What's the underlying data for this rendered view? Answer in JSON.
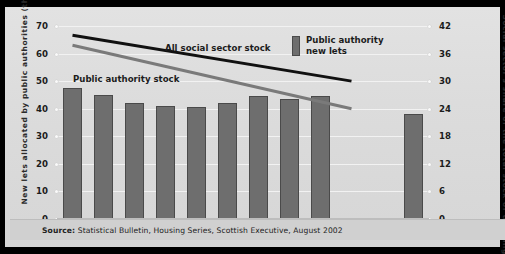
{
  "chart_data": {
    "type": "bar",
    "title": "",
    "xlabel": "",
    "ylabel": "New lets allocated by public authorities (thousands)",
    "ylabel_right": "Social sector's share of the total stock of dwellings (per cent)",
    "categories": [
      "1991",
      "1992",
      "1993",
      "1994",
      "1995",
      "1996",
      "1997",
      "1998",
      "1999",
      "2000",
      "2001",
      "2002"
    ],
    "ylim": [
      0,
      70
    ],
    "yticks": [
      0,
      10,
      20,
      30,
      40,
      50,
      60,
      70
    ],
    "ylim_right": [
      0,
      42
    ],
    "yticks_right": [
      0,
      6,
      12,
      18,
      24,
      30,
      36,
      42
    ],
    "grid": true,
    "legend_position": "top-right",
    "series": [
      {
        "name": "Public authority new lets",
        "type": "bar",
        "axis": "left",
        "color": "#6e6e6e",
        "values": [
          47.5,
          45.0,
          42.0,
          41.0,
          40.5,
          42.0,
          44.5,
          43.5,
          44.5,
          null,
          null,
          38.0
        ]
      },
      {
        "name": "All social sector stock",
        "type": "line",
        "axis": "right",
        "color": "#111111",
        "x": [
          "1991",
          "2000"
        ],
        "values": [
          40.0,
          30.0
        ]
      },
      {
        "name": "Public authority stock",
        "type": "line",
        "axis": "right",
        "color": "#7a7a7a",
        "x": [
          "1991",
          "2000"
        ],
        "values": [
          37.8,
          24.0
        ]
      }
    ],
    "annotations": [
      {
        "text": "All social sector stock",
        "x": "1995",
        "y": 36
      },
      {
        "text": "Public authority stock",
        "x": "1992",
        "y": 30
      }
    ]
  },
  "axes": {
    "left_title": "New lets allocated by public authorities (thousands)",
    "right_title": "Social sector's share of the total stock of dwellings (per cent)",
    "left_ticks": [
      "70",
      "60",
      "50",
      "40",
      "30",
      "20",
      "10",
      "0"
    ],
    "right_ticks": [
      "42",
      "36",
      "30",
      "24",
      "18",
      "12",
      "6",
      "0"
    ],
    "x_labels": [
      "1991",
      "1992",
      "1993",
      "1994",
      "1995",
      "1996",
      "1997",
      "1998",
      "1999",
      "2000",
      "2001",
      "2002"
    ]
  },
  "legend": {
    "entries": [
      {
        "label_line1": "Public authority",
        "label_line2": "new lets",
        "color": "#6e6e6e",
        "marker": "bar-swatch"
      }
    ]
  },
  "annotations": {
    "all_social_sector_stock": "All social sector stock",
    "public_authority_stock": "Public authority stock"
  },
  "source": {
    "prefix": "Source:",
    "text": "Statistical Bulletin, Housing Series, Scottish Executive, August 2002"
  }
}
